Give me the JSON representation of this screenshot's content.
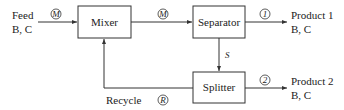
{
  "diagram": {
    "feed": {
      "label": "Feed",
      "components": "B, C",
      "stream": "F"
    },
    "units": {
      "mixer": "Mixer",
      "separator": "Separator",
      "splitter": "Splitter"
    },
    "streams": {
      "mixer_out": "M",
      "split": "S",
      "product1_stream": "1",
      "product2_stream": "2",
      "recycle_stream": "R"
    },
    "product1": {
      "label": "Product 1",
      "components": "B, C"
    },
    "product2": {
      "label": "Product 2",
      "components": "B, C"
    },
    "recycle": {
      "label": "Recycle"
    }
  }
}
